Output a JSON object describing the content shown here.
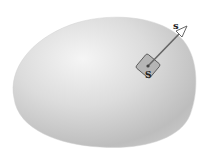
{
  "diagram": {
    "surface": {
      "label": "",
      "fill_light": "#f4f4f4",
      "fill_dark": "#b9b9b9"
    },
    "patch": {
      "label": "S",
      "fill": "#a9a9a9",
      "stroke": "#555555"
    },
    "vector": {
      "label": "s",
      "color": "#555555"
    }
  }
}
